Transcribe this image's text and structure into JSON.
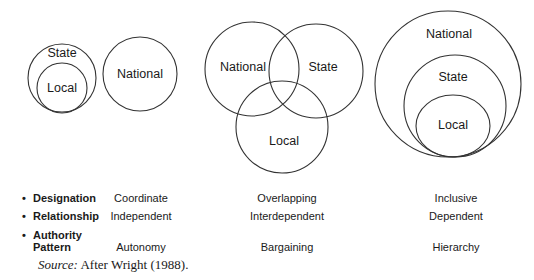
{
  "diagrams": {
    "coordinate": {
      "state_label": "State",
      "local_label": "Local",
      "national_label": "National"
    },
    "overlapping": {
      "national_label": "National",
      "state_label": "State",
      "local_label": "Local"
    },
    "inclusive": {
      "national_label": "National",
      "state_label": "State",
      "local_label": "Local"
    }
  },
  "table": {
    "rows": [
      {
        "bullet": "•",
        "label": "Designation",
        "values": [
          "Coordinate",
          "Overlapping",
          "Inclusive"
        ]
      },
      {
        "bullet": "•",
        "label": "Relationship",
        "values": [
          "Independent",
          "Interdependent",
          "Dependent"
        ]
      },
      {
        "bullet": "•",
        "label_line1": "Authority",
        "label_line2": "Pattern",
        "values": [
          "Autonomy",
          "Bargaining",
          "Hierarchy"
        ]
      }
    ]
  },
  "source": {
    "prefix": "Source:",
    "text": " After Wright (1988)."
  }
}
